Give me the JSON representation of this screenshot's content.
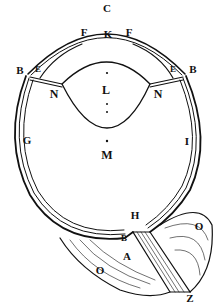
{
  "figure": {
    "colors": {
      "ink": "#111111",
      "paper": "#ffffff"
    }
  },
  "labels": [
    {
      "id": "C",
      "text": "C",
      "x": 107,
      "y": 8
    },
    {
      "id": "F-left",
      "text": "F",
      "x": 84,
      "y": 32
    },
    {
      "id": "K",
      "text": "K",
      "x": 108,
      "y": 34
    },
    {
      "id": "F-right",
      "text": "F",
      "x": 129,
      "y": 32
    },
    {
      "id": "B-left",
      "text": "B",
      "x": 20,
      "y": 70
    },
    {
      "id": "E-left",
      "text": "E",
      "x": 38,
      "y": 69
    },
    {
      "id": "E-right",
      "text": "E",
      "x": 173,
      "y": 69
    },
    {
      "id": "B-right",
      "text": "B",
      "x": 193,
      "y": 69
    },
    {
      "id": "N-left",
      "text": "N",
      "x": 54,
      "y": 94
    },
    {
      "id": "L",
      "text": "L",
      "x": 106,
      "y": 90
    },
    {
      "id": "N-right",
      "text": "N",
      "x": 158,
      "y": 94
    },
    {
      "id": "G",
      "text": "G",
      "x": 27,
      "y": 140
    },
    {
      "id": "M",
      "text": "M",
      "x": 107,
      "y": 155
    },
    {
      "id": "I",
      "text": "I",
      "x": 187,
      "y": 141
    },
    {
      "id": "H",
      "text": "H",
      "x": 135,
      "y": 215
    },
    {
      "id": "B-lower",
      "text": "B",
      "x": 124,
      "y": 238
    },
    {
      "id": "A",
      "text": "A",
      "x": 127,
      "y": 256
    },
    {
      "id": "O-left",
      "text": "O",
      "x": 100,
      "y": 270
    },
    {
      "id": "O-right",
      "text": "O",
      "x": 199,
      "y": 226
    },
    {
      "id": "Z",
      "text": "Z",
      "x": 190,
      "y": 298
    }
  ]
}
